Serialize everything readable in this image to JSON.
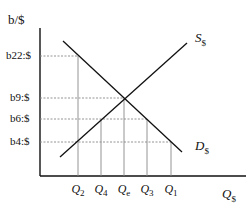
{
  "axes": {
    "y_label": "b/$",
    "x_label_main": "Q",
    "x_label_sub": "$"
  },
  "price_levels": [
    {
      "label": "b22:$",
      "y": 56
    },
    {
      "label": "b9:$",
      "y": 98
    },
    {
      "label": "b6:$",
      "y": 119
    },
    {
      "label": "b4:$",
      "y": 142
    }
  ],
  "quantity_levels": [
    {
      "main": "Q",
      "sub": "2",
      "x": 78
    },
    {
      "main": "Q",
      "sub": "4",
      "x": 101
    },
    {
      "main": "Q",
      "sub": "e",
      "x": 124
    },
    {
      "main": "Q",
      "sub": "3",
      "x": 147
    },
    {
      "main": "Q",
      "sub": "1",
      "x": 171
    }
  ],
  "curves": {
    "supply": {
      "main": "S",
      "sub": "$"
    },
    "demand": {
      "main": "D",
      "sub": "$"
    }
  },
  "colors": {
    "line": "#111111",
    "dashed": "#888888"
  }
}
